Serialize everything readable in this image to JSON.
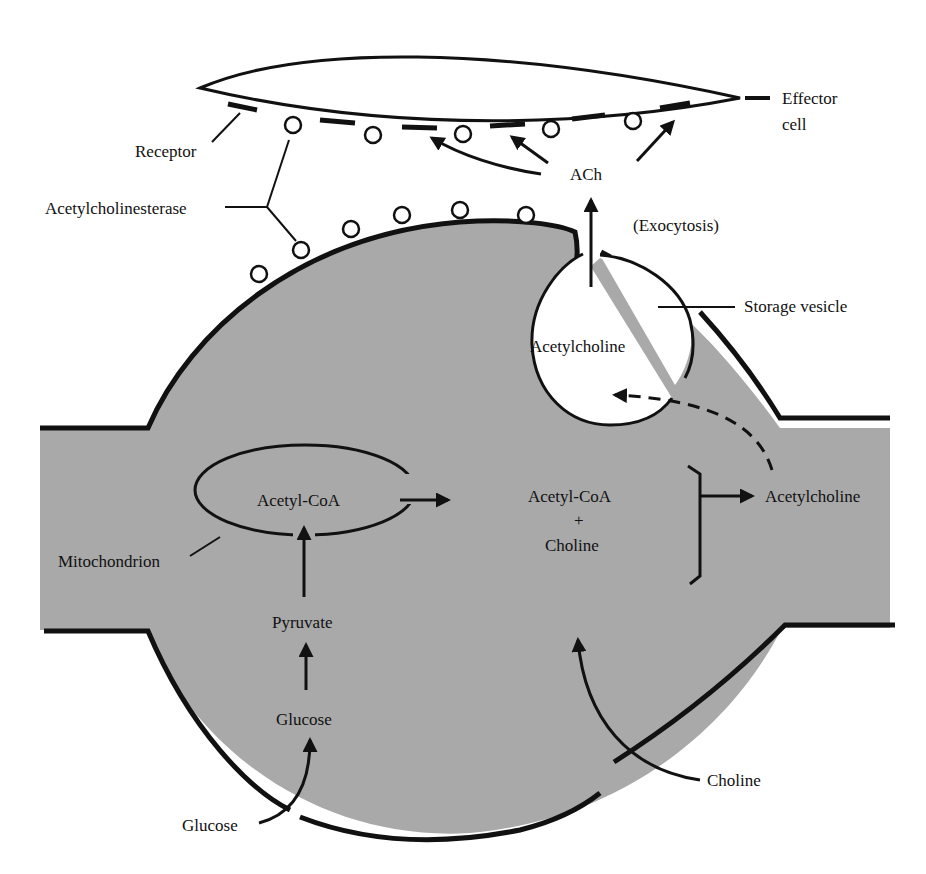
{
  "colors": {
    "cytoplasm": "#a9a9a9",
    "outline": "#111111",
    "background": "#ffffff"
  },
  "labels": {
    "effector": "Effector",
    "effector_cell": "cell",
    "receptor": "Receptor",
    "acetylcholinesterase": "Acetylcholinesterase",
    "ach": "ACh",
    "exocytosis": "(Exocytosis)",
    "storage_vesicle": "Storage vesicle",
    "vesicle_content": "Acetylcholine",
    "mito_content": "Acetyl-CoA",
    "mitochondrion": "Mitochondrion",
    "pyruvate": "Pyruvate",
    "glucose_inside": "Glucose",
    "glucose_outside": "Glucose",
    "substrate_line1": "Acetyl-CoA",
    "substrate_plus": "+",
    "substrate_line2": "Choline",
    "product": "Acetylcholine",
    "choline_outside": "Choline"
  }
}
